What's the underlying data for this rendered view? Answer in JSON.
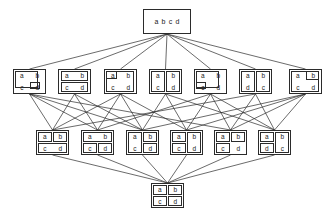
{
  "figure": {
    "kind": "hasse-diagram",
    "title": "",
    "ground_set": [
      "a",
      "b",
      "c",
      "d"
    ],
    "element_labels": {
      "a": "a",
      "b": "b",
      "c": "c",
      "d": "d"
    },
    "colors": {
      "background": "#ffffff",
      "stroke": "#2b2b2b",
      "text": "#222222"
    },
    "levels": 4,
    "node_count": 15,
    "edge_count": 38
  },
  "chart_data": {
    "type": "diagram",
    "title": "",
    "nodes": [
      {
        "id": "n0",
        "level": 0,
        "label": "a b c d",
        "blocks": [
          [
            "a",
            "b",
            "c",
            "d"
          ]
        ],
        "style": "single-row",
        "x": 143,
        "y": 9,
        "w": 48,
        "h": 25
      },
      {
        "id": "n1",
        "level": 1,
        "label": "a b c | d",
        "blocks": [
          [
            "a",
            "b",
            "c"
          ],
          [
            "d"
          ]
        ],
        "style": "grid",
        "boxes": [
          {
            "left": 3,
            "top": 3,
            "width": 74,
            "height": 74
          },
          {
            "left": 52,
            "top": 52,
            "width": 32,
            "height": 32
          }
        ],
        "x": 13,
        "y": 69,
        "w": 33,
        "h": 25
      },
      {
        "id": "n2",
        "level": 1,
        "label": "a b | c d",
        "blocks": [
          [
            "a",
            "b"
          ],
          [
            "c",
            "d"
          ]
        ],
        "style": "grid",
        "boxes": [
          {
            "left": 6,
            "top": 4,
            "width": 88,
            "height": 44
          },
          {
            "left": 6,
            "top": 52,
            "width": 88,
            "height": 44
          }
        ],
        "x": 58,
        "y": 69,
        "w": 33,
        "h": 25
      },
      {
        "id": "n3",
        "level": 1,
        "label": "a | b c d",
        "blocks": [
          [
            "a"
          ],
          [
            "b",
            "c",
            "d"
          ]
        ],
        "style": "grid",
        "boxes": [
          {
            "left": 4,
            "top": 4,
            "width": 34,
            "height": 34
          },
          {
            "left": 4,
            "top": 4,
            "width": 90,
            "height": 90
          }
        ],
        "x": 104,
        "y": 69,
        "w": 33,
        "h": 25
      },
      {
        "id": "n4",
        "level": 1,
        "label": "a c | b d",
        "blocks": [
          [
            "a",
            "c"
          ],
          [
            "b",
            "d"
          ]
        ],
        "style": "grid",
        "boxes": [
          {
            "left": 4,
            "top": 4,
            "width": 44,
            "height": 90
          },
          {
            "left": 52,
            "top": 4,
            "width": 44,
            "height": 90
          }
        ],
        "x": 149,
        "y": 69,
        "w": 33,
        "h": 25
      },
      {
        "id": "n5",
        "level": 1,
        "label": "a b d | c",
        "blocks": [
          [
            "a",
            "b",
            "d"
          ],
          [
            "c"
          ]
        ],
        "style": "grid",
        "boxes": [
          {
            "left": 3,
            "top": 3,
            "width": 74,
            "height": 74
          },
          {
            "left": 3,
            "top": 52,
            "width": 32,
            "height": 32
          }
        ],
        "x": 194,
        "y": 69,
        "w": 33,
        "h": 25
      },
      {
        "id": "n6",
        "level": 1,
        "label": "a d | b c",
        "blocks": [
          [
            "a",
            "d"
          ],
          [
            "b",
            "c"
          ]
        ],
        "style": "grid-swapped",
        "boxes": [
          {
            "left": 4,
            "top": 4,
            "width": 44,
            "height": 90
          },
          {
            "left": 52,
            "top": 4,
            "width": 44,
            "height": 90
          }
        ],
        "x": 239,
        "y": 69,
        "w": 33,
        "h": 25
      },
      {
        "id": "n7",
        "level": 1,
        "label": "a c d | b",
        "blocks": [
          [
            "a",
            "c",
            "d"
          ],
          [
            "b"
          ]
        ],
        "style": "grid",
        "boxes": [
          {
            "left": 4,
            "top": 4,
            "width": 90,
            "height": 90
          },
          {
            "left": 52,
            "top": 4,
            "width": 40,
            "height": 40
          }
        ],
        "x": 289,
        "y": 69,
        "w": 33,
        "h": 25
      },
      {
        "id": "n8",
        "level": 2,
        "label": "a | b | c d",
        "blocks": [
          [
            "a"
          ],
          [
            "b"
          ],
          [
            "c",
            "d"
          ]
        ],
        "style": "grid",
        "boxes": [
          {
            "left": 4,
            "top": 4,
            "width": 44,
            "height": 44
          },
          {
            "left": 52,
            "top": 4,
            "width": 44,
            "height": 44
          },
          {
            "left": 4,
            "top": 52,
            "width": 92,
            "height": 44
          }
        ],
        "x": 36,
        "y": 130,
        "w": 33,
        "h": 25
      },
      {
        "id": "n9",
        "level": 2,
        "label": "a b | c | d",
        "blocks": [
          [
            "a",
            "b"
          ],
          [
            "c"
          ],
          [
            "d"
          ]
        ],
        "style": "grid",
        "boxes": [
          {
            "left": 4,
            "top": 4,
            "width": 92,
            "height": 44
          },
          {
            "left": 4,
            "top": 52,
            "width": 44,
            "height": 44
          },
          {
            "left": 52,
            "top": 52,
            "width": 44,
            "height": 44
          }
        ],
        "x": 81,
        "y": 130,
        "w": 33,
        "h": 25
      },
      {
        "id": "n10",
        "level": 2,
        "label": "a c | b | d",
        "blocks": [
          [
            "a",
            "c"
          ],
          [
            "b"
          ],
          [
            "d"
          ]
        ],
        "style": "grid",
        "boxes": [
          {
            "left": 4,
            "top": 4,
            "width": 44,
            "height": 92
          },
          {
            "left": 52,
            "top": 4,
            "width": 44,
            "height": 44
          },
          {
            "left": 52,
            "top": 52,
            "width": 44,
            "height": 44
          }
        ],
        "x": 126,
        "y": 130,
        "w": 33,
        "h": 25
      },
      {
        "id": "n11",
        "level": 2,
        "label": "a | b d | c",
        "blocks": [
          [
            "a"
          ],
          [
            "b",
            "d"
          ],
          [
            "c"
          ]
        ],
        "style": "grid",
        "boxes": [
          {
            "left": 4,
            "top": 4,
            "width": 44,
            "height": 44
          },
          {
            "left": 52,
            "top": 4,
            "width": 44,
            "height": 92
          },
          {
            "left": 4,
            "top": 52,
            "width": 44,
            "height": 44
          }
        ],
        "x": 170,
        "y": 130,
        "w": 33,
        "h": 25
      },
      {
        "id": "n12",
        "level": 2,
        "label": "a d | b | c",
        "blocks": [
          [
            "a",
            "d"
          ],
          [
            "b"
          ],
          [
            "c"
          ]
        ],
        "style": "grid",
        "boxes": [
          {
            "left": 4,
            "top": 4,
            "width": 44,
            "height": 44
          },
          {
            "left": 52,
            "top": 4,
            "width": 44,
            "height": 44
          },
          {
            "left": 4,
            "top": 52,
            "width": 44,
            "height": 44
          }
        ],
        "x": 214,
        "y": 130,
        "w": 33,
        "h": 25
      },
      {
        "id": "n13",
        "level": 2,
        "label": "a d | b c",
        "blocks": [
          [
            "a",
            "d"
          ],
          [
            "b",
            "c"
          ]
        ],
        "style": "grid-swapped",
        "boxes": [
          {
            "left": 4,
            "top": 4,
            "width": 44,
            "height": 44
          },
          {
            "left": 52,
            "top": 4,
            "width": 44,
            "height": 92
          },
          {
            "left": 4,
            "top": 52,
            "width": 44,
            "height": 44
          }
        ],
        "x": 258,
        "y": 130,
        "w": 33,
        "h": 25
      },
      {
        "id": "n14",
        "level": 3,
        "label": "a | b | c | d",
        "blocks": [
          [
            "a"
          ],
          [
            "b"
          ],
          [
            "c"
          ],
          [
            "d"
          ]
        ],
        "style": "grid",
        "boxes": [
          {
            "left": 4,
            "top": 4,
            "width": 44,
            "height": 44
          },
          {
            "left": 52,
            "top": 4,
            "width": 44,
            "height": 44
          },
          {
            "left": 4,
            "top": 52,
            "width": 44,
            "height": 44
          },
          {
            "left": 52,
            "top": 52,
            "width": 44,
            "height": 44
          }
        ],
        "x": 151,
        "y": 183,
        "w": 33,
        "h": 25
      }
    ],
    "edges": [
      {
        "from": "n0",
        "to": "n1"
      },
      {
        "from": "n0",
        "to": "n2"
      },
      {
        "from": "n0",
        "to": "n3"
      },
      {
        "from": "n0",
        "to": "n4"
      },
      {
        "from": "n0",
        "to": "n5"
      },
      {
        "from": "n0",
        "to": "n6"
      },
      {
        "from": "n0",
        "to": "n7"
      },
      {
        "from": "n1",
        "to": "n8"
      },
      {
        "from": "n1",
        "to": "n9"
      },
      {
        "from": "n1",
        "to": "n10"
      },
      {
        "from": "n1",
        "to": "n12"
      },
      {
        "from": "n2",
        "to": "n8"
      },
      {
        "from": "n2",
        "to": "n9"
      },
      {
        "from": "n3",
        "to": "n8"
      },
      {
        "from": "n3",
        "to": "n9"
      },
      {
        "from": "n3",
        "to": "n10"
      },
      {
        "from": "n3",
        "to": "n11"
      },
      {
        "from": "n4",
        "to": "n10"
      },
      {
        "from": "n4",
        "to": "n11"
      },
      {
        "from": "n5",
        "to": "n9"
      },
      {
        "from": "n5",
        "to": "n11"
      },
      {
        "from": "n5",
        "to": "n12"
      },
      {
        "from": "n5",
        "to": "n13"
      },
      {
        "from": "n6",
        "to": "n12"
      },
      {
        "from": "n6",
        "to": "n13"
      },
      {
        "from": "n7",
        "to": "n10"
      },
      {
        "from": "n7",
        "to": "n11"
      },
      {
        "from": "n7",
        "to": "n12"
      },
      {
        "from": "n7",
        "to": "n13"
      },
      {
        "from": "n2",
        "to": "n10"
      },
      {
        "from": "n6",
        "to": "n8"
      },
      {
        "from": "n4",
        "to": "n13"
      },
      {
        "from": "n8",
        "to": "n14"
      },
      {
        "from": "n9",
        "to": "n14"
      },
      {
        "from": "n10",
        "to": "n14"
      },
      {
        "from": "n11",
        "to": "n14"
      },
      {
        "from": "n12",
        "to": "n14"
      },
      {
        "from": "n13",
        "to": "n14"
      }
    ]
  }
}
